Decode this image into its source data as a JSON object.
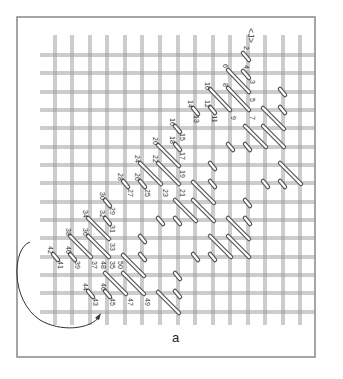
{
  "figure": {
    "caption": "a",
    "direction_marker": "<J>",
    "frame": {
      "x": 17,
      "y": 17,
      "w": 298,
      "h": 340
    },
    "colors": {
      "frame": "#888888",
      "canvas_thread": "#9a9a9a",
      "stitch_outline": "#555555",
      "stitch_fill": "#ffffff",
      "text": "#333333",
      "arrow": "#333333"
    }
  },
  "grid": {
    "vertical_x": [
      55,
      72,
      90,
      107,
      125,
      142,
      160,
      178,
      195,
      213,
      230,
      248,
      265,
      283,
      300
    ],
    "horizontal_y": [
      55,
      73,
      92,
      110,
      128,
      147,
      165,
      183,
      202,
      220,
      238,
      257,
      275,
      293,
      312
    ],
    "x_range": [
      40,
      315
    ],
    "y_range": [
      35,
      325
    ]
  },
  "stitches": [
    {
      "x1": 243,
      "y1": 53,
      "x2": 249,
      "y2": 60
    },
    {
      "x1": 243,
      "y1": 71,
      "x2": 249,
      "y2": 78
    },
    {
      "x1": 228,
      "y1": 70,
      "x2": 249,
      "y2": 92
    },
    {
      "x1": 228,
      "y1": 88,
      "x2": 249,
      "y2": 110
    },
    {
      "x1": 210,
      "y1": 89,
      "x2": 230,
      "y2": 110
    },
    {
      "x1": 210,
      "y1": 107,
      "x2": 215,
      "y2": 113
    },
    {
      "x1": 193,
      "y1": 108,
      "x2": 198,
      "y2": 114
    },
    {
      "x1": 280,
      "y1": 89,
      "x2": 285,
      "y2": 95
    },
    {
      "x1": 280,
      "y1": 107,
      "x2": 285,
      "y2": 113
    },
    {
      "x1": 263,
      "y1": 108,
      "x2": 284,
      "y2": 129
    },
    {
      "x1": 263,
      "y1": 126,
      "x2": 284,
      "y2": 147
    },
    {
      "x1": 245,
      "y1": 126,
      "x2": 266,
      "y2": 147
    },
    {
      "x1": 245,
      "y1": 144,
      "x2": 250,
      "y2": 150
    },
    {
      "x1": 228,
      "y1": 144,
      "x2": 233,
      "y2": 150
    },
    {
      "x1": 280,
      "y1": 163,
      "x2": 301,
      "y2": 184
    },
    {
      "x1": 263,
      "y1": 181,
      "x2": 268,
      "y2": 187
    },
    {
      "x1": 280,
      "y1": 181,
      "x2": 285,
      "y2": 187
    },
    {
      "x1": 175,
      "y1": 126,
      "x2": 180,
      "y2": 132
    },
    {
      "x1": 175,
      "y1": 144,
      "x2": 180,
      "y2": 150
    },
    {
      "x1": 158,
      "y1": 145,
      "x2": 179,
      "y2": 166
    },
    {
      "x1": 158,
      "y1": 163,
      "x2": 179,
      "y2": 184
    },
    {
      "x1": 140,
      "y1": 163,
      "x2": 161,
      "y2": 184
    },
    {
      "x1": 140,
      "y1": 181,
      "x2": 145,
      "y2": 187
    },
    {
      "x1": 123,
      "y1": 181,
      "x2": 128,
      "y2": 187
    },
    {
      "x1": 210,
      "y1": 163,
      "x2": 215,
      "y2": 169
    },
    {
      "x1": 210,
      "y1": 181,
      "x2": 215,
      "y2": 187
    },
    {
      "x1": 193,
      "y1": 182,
      "x2": 214,
      "y2": 203
    },
    {
      "x1": 193,
      "y1": 200,
      "x2": 214,
      "y2": 221
    },
    {
      "x1": 175,
      "y1": 200,
      "x2": 196,
      "y2": 221
    },
    {
      "x1": 175,
      "y1": 218,
      "x2": 180,
      "y2": 224
    },
    {
      "x1": 158,
      "y1": 218,
      "x2": 163,
      "y2": 224
    },
    {
      "x1": 245,
      "y1": 200,
      "x2": 250,
      "y2": 206
    },
    {
      "x1": 245,
      "y1": 218,
      "x2": 250,
      "y2": 224
    },
    {
      "x1": 228,
      "y1": 218,
      "x2": 249,
      "y2": 239
    },
    {
      "x1": 228,
      "y1": 236,
      "x2": 249,
      "y2": 257
    },
    {
      "x1": 210,
      "y1": 236,
      "x2": 231,
      "y2": 257
    },
    {
      "x1": 210,
      "y1": 254,
      "x2": 215,
      "y2": 260
    },
    {
      "x1": 193,
      "y1": 254,
      "x2": 198,
      "y2": 260
    },
    {
      "x1": 105,
      "y1": 200,
      "x2": 110,
      "y2": 206
    },
    {
      "x1": 105,
      "y1": 218,
      "x2": 110,
      "y2": 224
    },
    {
      "x1": 88,
      "y1": 218,
      "x2": 109,
      "y2": 239
    },
    {
      "x1": 88,
      "y1": 236,
      "x2": 109,
      "y2": 257
    },
    {
      "x1": 70,
      "y1": 236,
      "x2": 91,
      "y2": 257
    },
    {
      "x1": 70,
      "y1": 254,
      "x2": 75,
      "y2": 260
    },
    {
      "x1": 53,
      "y1": 254,
      "x2": 58,
      "y2": 260
    },
    {
      "x1": 140,
      "y1": 236,
      "x2": 145,
      "y2": 242
    },
    {
      "x1": 140,
      "y1": 254,
      "x2": 145,
      "y2": 260
    },
    {
      "x1": 123,
      "y1": 255,
      "x2": 144,
      "y2": 276
    },
    {
      "x1": 123,
      "y1": 273,
      "x2": 144,
      "y2": 294
    },
    {
      "x1": 105,
      "y1": 273,
      "x2": 126,
      "y2": 294
    },
    {
      "x1": 105,
      "y1": 291,
      "x2": 110,
      "y2": 297
    },
    {
      "x1": 88,
      "y1": 291,
      "x2": 93,
      "y2": 297
    },
    {
      "x1": 175,
      "y1": 273,
      "x2": 180,
      "y2": 279
    },
    {
      "x1": 175,
      "y1": 291,
      "x2": 180,
      "y2": 297
    },
    {
      "x1": 158,
      "y1": 292,
      "x2": 179,
      "y2": 313
    }
  ],
  "labels": [
    {
      "text": "2",
      "x": 244,
      "y": 48
    },
    {
      "text": "4",
      "x": 244,
      "y": 67
    },
    {
      "text": "6",
      "x": 223,
      "y": 66
    },
    {
      "text": "3",
      "x": 250,
      "y": 82
    },
    {
      "text": "8",
      "x": 223,
      "y": 85
    },
    {
      "text": "10",
      "x": 205,
      "y": 86
    },
    {
      "text": "5",
      "x": 250,
      "y": 100
    },
    {
      "text": "12",
      "x": 205,
      "y": 104
    },
    {
      "text": "14",
      "x": 188,
      "y": 104
    },
    {
      "text": "9",
      "x": 231,
      "y": 118
    },
    {
      "text": "7",
      "x": 250,
      "y": 118
    },
    {
      "text": "11",
      "x": 212,
      "y": 119
    },
    {
      "text": "13",
      "x": 194,
      "y": 119
    },
    {
      "text": "16",
      "x": 170,
      "y": 122
    },
    {
      "text": "15",
      "x": 180,
      "y": 137
    },
    {
      "text": "18",
      "x": 170,
      "y": 140
    },
    {
      "text": "20",
      "x": 153,
      "y": 141
    },
    {
      "text": "17",
      "x": 180,
      "y": 156
    },
    {
      "text": "22",
      "x": 153,
      "y": 159
    },
    {
      "text": "24",
      "x": 135,
      "y": 159
    },
    {
      "text": "19",
      "x": 180,
      "y": 174
    },
    {
      "text": "26",
      "x": 135,
      "y": 177
    },
    {
      "text": "28",
      "x": 118,
      "y": 177
    },
    {
      "text": "21",
      "x": 180,
      "y": 193
    },
    {
      "text": "23",
      "x": 163,
      "y": 193
    },
    {
      "text": "25",
      "x": 145,
      "y": 193
    },
    {
      "text": "27",
      "x": 128,
      "y": 193
    },
    {
      "text": "30",
      "x": 100,
      "y": 196
    },
    {
      "text": "29",
      "x": 110,
      "y": 211
    },
    {
      "text": "32",
      "x": 100,
      "y": 214
    },
    {
      "text": "34",
      "x": 83,
      "y": 214
    },
    {
      "text": "31",
      "x": 110,
      "y": 229
    },
    {
      "text": "36",
      "x": 83,
      "y": 232
    },
    {
      "text": "38",
      "x": 66,
      "y": 232
    },
    {
      "text": "33",
      "x": 110,
      "y": 247
    },
    {
      "text": "40",
      "x": 66,
      "y": 250
    },
    {
      "text": "42",
      "x": 48,
      "y": 250
    },
    {
      "text": "35",
      "x": 110,
      "y": 265
    },
    {
      "text": "37",
      "x": 92,
      "y": 265
    },
    {
      "text": "39",
      "x": 75,
      "y": 265
    },
    {
      "text": "41",
      "x": 58,
      "y": 265
    },
    {
      "text": "48",
      "x": 101,
      "y": 265
    },
    {
      "text": "50",
      "x": 118,
      "y": 265
    },
    {
      "text": "44",
      "x": 83,
      "y": 287
    },
    {
      "text": "46",
      "x": 101,
      "y": 287
    },
    {
      "text": "43",
      "x": 93,
      "y": 302
    },
    {
      "text": "45",
      "x": 110,
      "y": 302
    },
    {
      "text": "47",
      "x": 128,
      "y": 302
    },
    {
      "text": "49",
      "x": 145,
      "y": 302
    }
  ],
  "arrow": {
    "path": "M 30 242 C 12 248, 10 300, 40 320 C 60 332, 90 330, 100 316",
    "head": {
      "x": 100,
      "y": 316
    }
  }
}
